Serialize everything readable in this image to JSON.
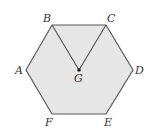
{
  "figure": {
    "shape": "regular hexagon",
    "fill_color": "#e6e6e6",
    "stroke_color": "#5a5a5a",
    "center_point_color": "#111111",
    "vertices": [
      {
        "label": "A",
        "x": 26,
        "y": 70
      },
      {
        "label": "B",
        "x": 52,
        "y": 25
      },
      {
        "label": "C",
        "x": 106,
        "y": 25
      },
      {
        "label": "D",
        "x": 133,
        "y": 70
      },
      {
        "label": "E",
        "x": 106,
        "y": 114
      },
      {
        "label": "F",
        "x": 52,
        "y": 114
      }
    ],
    "center": {
      "label": "G",
      "x": 79,
      "y": 70
    },
    "segments": [
      "BG",
      "CG"
    ]
  },
  "labels": {
    "A": "A",
    "B": "B",
    "C": "C",
    "D": "D",
    "E": "E",
    "F": "F",
    "G": "G"
  }
}
